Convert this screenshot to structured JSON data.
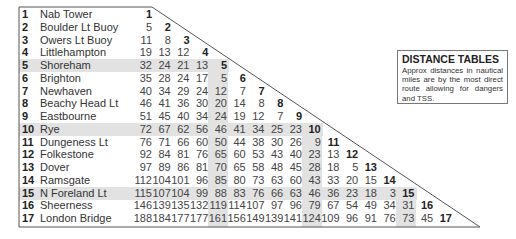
{
  "info": {
    "title": "DISTANCE TABLES",
    "text": "Approx distances in nautical miles are by the most direct route allowing for dangers and TSS."
  },
  "places": [
    {
      "num": "1",
      "name": "Nab Tower",
      "distances": []
    },
    {
      "num": "2",
      "name": "Boulder Lt Buoy",
      "distances": [
        5
      ]
    },
    {
      "num": "3",
      "name": "Owers Lt Buoy",
      "distances": [
        11,
        8
      ]
    },
    {
      "num": "4",
      "name": "Littlehampton",
      "distances": [
        19,
        13,
        12
      ]
    },
    {
      "num": "5",
      "name": "Shoreham",
      "distances": [
        32,
        24,
        21,
        13
      ]
    },
    {
      "num": "6",
      "name": "Brighton",
      "distances": [
        35,
        28,
        24,
        17,
        5
      ]
    },
    {
      "num": "7",
      "name": "Newhaven",
      "distances": [
        40,
        34,
        29,
        24,
        12,
        7
      ]
    },
    {
      "num": "8",
      "name": "Beachy Head Lt",
      "distances": [
        46,
        41,
        36,
        30,
        20,
        14,
        8
      ]
    },
    {
      "num": "9",
      "name": "Eastbourne",
      "distances": [
        51,
        45,
        40,
        34,
        24,
        19,
        12,
        7
      ]
    },
    {
      "num": "10",
      "name": "Rye",
      "distances": [
        72,
        67,
        62,
        56,
        46,
        41,
        34,
        25,
        23
      ]
    },
    {
      "num": "11",
      "name": "Dungeness Lt",
      "distances": [
        76,
        71,
        66,
        60,
        50,
        44,
        38,
        30,
        26,
        9
      ]
    },
    {
      "num": "12",
      "name": "Folkestone",
      "distances": [
        92,
        84,
        81,
        76,
        65,
        60,
        53,
        43,
        40,
        23,
        13
      ]
    },
    {
      "num": "13",
      "name": "Dover",
      "distances": [
        97,
        89,
        86,
        81,
        70,
        65,
        58,
        48,
        45,
        28,
        18,
        5
      ]
    },
    {
      "num": "14",
      "name": "Ramsgate",
      "distances": [
        112,
        104,
        101,
        96,
        85,
        80,
        73,
        63,
        60,
        43,
        33,
        20,
        15
      ]
    },
    {
      "num": "15",
      "name": "N Foreland Lt",
      "distances": [
        115,
        107,
        104,
        99,
        88,
        83,
        76,
        66,
        63,
        46,
        36,
        23,
        18,
        3
      ]
    },
    {
      "num": "16",
      "name": "Sheerness",
      "distances": [
        146,
        139,
        135,
        132,
        119,
        114,
        107,
        97,
        96,
        79,
        67,
        54,
        49,
        34,
        31
      ]
    },
    {
      "num": "17",
      "name": "London Bridge",
      "distances": [
        188,
        184,
        177,
        177,
        161,
        156,
        149,
        139,
        141,
        124,
        109,
        96,
        91,
        76,
        73,
        45
      ]
    }
  ],
  "highlighted_indices": [
    5,
    10,
    15
  ],
  "colors": {
    "highlight": "#e2e2e2",
    "border": "#555555",
    "text": "#333333"
  }
}
